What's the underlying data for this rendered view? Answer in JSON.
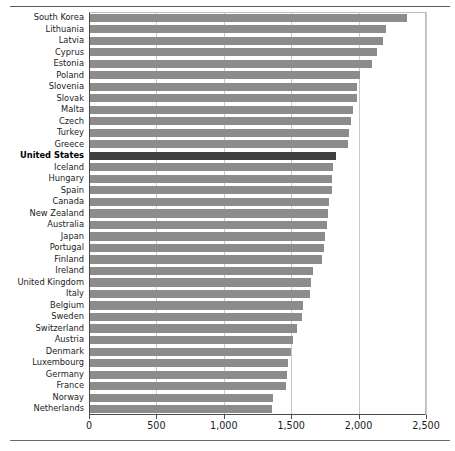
{
  "chart_data": {
    "type": "bar",
    "orientation": "horizontal",
    "title": "",
    "subtitle": "",
    "xlabel": "",
    "ylabel": "",
    "xlim": [
      0,
      2500
    ],
    "xticks": [
      0,
      500,
      1000,
      1500,
      2000,
      2500
    ],
    "xticklabels": [
      "0",
      "500",
      "1,000",
      "1,500",
      "2,000",
      "2,500"
    ],
    "grid": true,
    "legend": "none",
    "highlight_category": "United States",
    "colors": {
      "bar": "#8c8c8c",
      "highlight_bar": "#3f3f3f",
      "grid": "#c9c9c9",
      "axis": "#4a4a4a",
      "background": "#ffffff"
    },
    "categories": [
      "South Korea",
      "Lithuania",
      "Latvia",
      "Cyprus",
      "Estonia",
      "Poland",
      "Slovenia",
      "Slovak",
      "Malta",
      "Czech",
      "Turkey",
      "Greece",
      "United States",
      "Iceland",
      "Hungary",
      "Spain",
      "Canada",
      "New Zealand",
      "Australia",
      "Japan",
      "Portugal",
      "Finland",
      "Ireland",
      "United Kingdom",
      "Italy",
      "Belgium",
      "Sweden",
      "Switzerland",
      "Austria",
      "Denmark",
      "Luxembourg",
      "Germany",
      "France",
      "Norway",
      "Netherlands"
    ],
    "values": [
      2360,
      2200,
      2180,
      2140,
      2100,
      2010,
      1990,
      1985,
      1960,
      1940,
      1930,
      1920,
      1830,
      1810,
      1805,
      1800,
      1780,
      1775,
      1765,
      1750,
      1740,
      1730,
      1660,
      1650,
      1640,
      1590,
      1580,
      1545,
      1510,
      1500,
      1475,
      1470,
      1460,
      1365,
      1355
    ]
  }
}
